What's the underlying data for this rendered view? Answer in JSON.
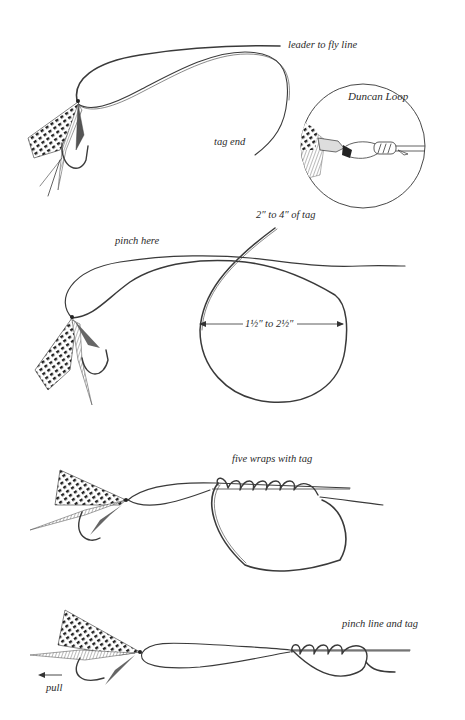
{
  "diagram": {
    "colors": {
      "ink": "#3a3a3a",
      "paper": "#ffffff"
    },
    "steps": [
      {
        "id": 1,
        "labels": {
          "leader": "leader to fly line",
          "tag_end": "tag end",
          "inset_title": "Duncan Loop"
        }
      },
      {
        "id": 2,
        "labels": {
          "pinch": "pinch here",
          "tag_length": "2″ to 4″ of tag",
          "loop_diameter": "1½″ to 2½″"
        }
      },
      {
        "id": 3,
        "labels": {
          "wraps": "five wraps with tag"
        },
        "wrap_count": 5
      },
      {
        "id": 4,
        "labels": {
          "pinch_both": "pinch line and tag",
          "pull": "pull"
        },
        "wrap_count": 4
      }
    ]
  }
}
